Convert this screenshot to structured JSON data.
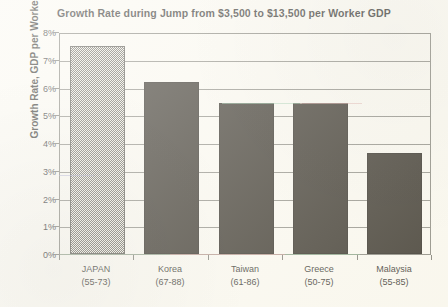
{
  "chart_data": {
    "type": "bar",
    "title": "Growth Rate during Jump from $3,500 to $13,500 per Worker GDP",
    "xlabel": "",
    "ylabel": "Growth Rate, GDP per Worker",
    "ylim": [
      0,
      8
    ],
    "ytick_labels": [
      "8%",
      "7%",
      "6%",
      "5%",
      "4%",
      "3%",
      "2%",
      "1%",
      "0%"
    ],
    "ytick_values": [
      8,
      7,
      6,
      5,
      4,
      3,
      2,
      1,
      0
    ],
    "grid": true,
    "legend": "none",
    "categories": [
      {
        "name": "JAPAN",
        "years": "(55-73)"
      },
      {
        "name": "Korea",
        "years": "(67-88)"
      },
      {
        "name": "Taiwan",
        "years": "(61-86)"
      },
      {
        "name": "Greece",
        "years": "(50-75)"
      },
      {
        "name": "Malaysia",
        "years": "(55-85)"
      }
    ],
    "values": [
      7.5,
      6.2,
      5.45,
      5.45,
      3.65
    ],
    "bar_styles": [
      "hatched",
      "solid",
      "solid",
      "solid",
      "solid"
    ],
    "colors": {
      "bar_solid": "#211c12",
      "bar_hatch": "#5c5a51",
      "axis": "#7b7a70",
      "text": "#1b1a16",
      "background": "#faf8ef"
    }
  }
}
